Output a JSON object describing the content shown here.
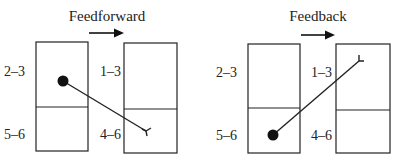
{
  "panels": [
    {
      "title": "Feedforward",
      "source_column": {
        "upper_label": "2–3",
        "lower_label": "5–6"
      },
      "target_column": {
        "upper_label": "1–3",
        "lower_label": "4–6"
      },
      "connection": {
        "from": "source layers 2–3",
        "to": "target layers 4–6",
        "direction": "forward"
      }
    },
    {
      "title": "Feedback",
      "source_column": {
        "upper_label": "2–3",
        "lower_label": "5–6"
      },
      "target_column": {
        "upper_label": "1–3",
        "lower_label": "4–6"
      },
      "connection": {
        "from": "source layers 5–6",
        "to": "target layers 1–3",
        "direction": "backward"
      }
    }
  ],
  "colors": {
    "ink": "#222222",
    "background": "#ffffff"
  },
  "icons": {
    "arrow": "right-arrow-icon",
    "soma": "cell-body-dot-icon",
    "terminal": "axon-terminal-icon"
  }
}
